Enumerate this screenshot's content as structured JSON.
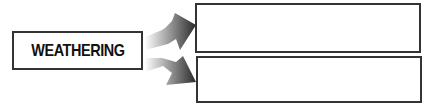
{
  "diagram": {
    "source": {
      "label": "WEATHERING"
    },
    "targets": [
      {
        "label": ""
      },
      {
        "label": ""
      }
    ],
    "colors": {
      "border": "#333333",
      "arrow_dark": "#2a2a2a",
      "arrow_light": "#ffffff"
    }
  }
}
